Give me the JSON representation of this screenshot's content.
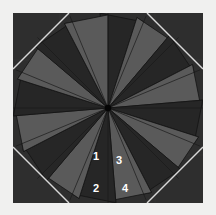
{
  "figure": {
    "title": "",
    "type": "pinwheel-star-diagram",
    "canvas": {
      "width": 216,
      "height": 215
    },
    "background_color": "#f0f0ef",
    "plot_area": {
      "x": 13,
      "y": 13,
      "width": 190,
      "height": 190,
      "fill_color": "#2e2e2e"
    },
    "center": {
      "x": 108,
      "y": 108
    },
    "octagon": {
      "corner_cut": 56,
      "edge_color": "#d8d8d8",
      "edge_width": 1.4,
      "description": "light diagonal chamfer lines across each of the four square corners"
    },
    "star": {
      "blade_count": 16,
      "outer_radius": 95,
      "blade_angular_width_deg": 22.5,
      "blade_skew_deg": 16,
      "light_blade_color": "#5a5a5a",
      "dark_blade_color": "#262626",
      "outline_color": "#141414",
      "outline_width": 0.8
    },
    "spokes": {
      "count": 16,
      "color": "#1a1a1a",
      "width": 0.7
    },
    "center_dot": {
      "radius": 3.2,
      "color": "#050505"
    },
    "gridlines": {
      "color": "#3a3a3a",
      "opacity": 0.35,
      "horizontal_y": [
        60,
        108,
        155
      ],
      "vertical_x": [
        60,
        108,
        155
      ]
    },
    "labels": [
      {
        "id": "label-1",
        "text": "1",
        "x": 96,
        "y": 157,
        "color": "#ffffff"
      },
      {
        "id": "label-3",
        "text": "3",
        "x": 119,
        "y": 161,
        "color": "#ffffff"
      },
      {
        "id": "label-2",
        "text": "2",
        "x": 96,
        "y": 189,
        "color": "#ffffff"
      },
      {
        "id": "label-4",
        "text": "4",
        "x": 125,
        "y": 189,
        "color": "#ffffff"
      }
    ]
  }
}
